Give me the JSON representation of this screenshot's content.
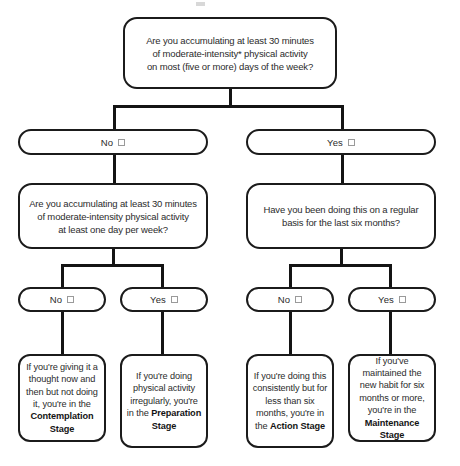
{
  "diagram": {
    "type": "decision-flowchart",
    "line_color": "#141414",
    "box_border_color": "#1b1b1b",
    "text_color": "#2b2b2b",
    "background": "#ffffff"
  },
  "questions": {
    "q1": {
      "line1": "Are you accumulating at least 30 minutes",
      "line2": "of moderate-intensity* physical activity",
      "line3": "on most (five or more) days of the week?"
    },
    "q2": {
      "line1": "Are you accumulating at least 30 minutes",
      "line2": "of moderate-intensity physical activity",
      "line3": "at least one day per week?"
    },
    "q3": {
      "line1": "Have you been doing this on a regular",
      "line2": "basis for the last six months?"
    }
  },
  "answers": {
    "a1_no": "No",
    "a1_yes": "Yes",
    "a2_no": "No",
    "a2_yes": "Yes",
    "a3_no": "No",
    "a3_yes": "Yes"
  },
  "outcomes": {
    "contemplation": {
      "body": "If you're giving it a thought now and then but not doing it, you're in the",
      "stage": "Contemplation Stage"
    },
    "preparation": {
      "body": "If you're doing physical activity irregularly, you're in the",
      "stage": "Preparation Stage"
    },
    "action": {
      "body": "If you're doing this consistently but for less than six months, you're in the",
      "stage": "Action Stage"
    },
    "maintenance": {
      "body": "If you've maintained the new habit for six months or more, you're in the",
      "stage": "Maintenance Stage"
    }
  }
}
